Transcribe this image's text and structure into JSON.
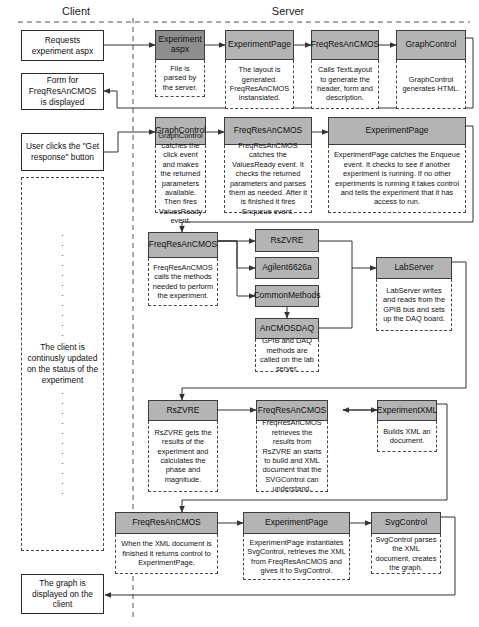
{
  "diagram": {
    "title_lanes": {
      "client": "Client",
      "server": "Server"
    },
    "client_boxes": [
      {
        "id": "requests",
        "text": "Requests experiment aspx"
      },
      {
        "id": "form-displayed",
        "text": "Form for FreqResAnCMOS is displayed"
      },
      {
        "id": "user-clicks",
        "text": "User clicks the \"Get response\" button"
      },
      {
        "id": "graph-displayed",
        "text": "The graph is displayed on the client"
      }
    ],
    "client_status": {
      "text": "The client is continusly updated on the status of the experiment",
      "dots_above": 11,
      "dots_below": 11
    },
    "nodes": [
      {
        "id": "experiment-aspx",
        "title": "Experiment aspx",
        "note": "File is parsed by the server.",
        "shade": "dark"
      },
      {
        "id": "experimentpage-1",
        "title": "ExperimentPage",
        "note": "The layout is generated. FreqResAnCMOS instansiated.",
        "shade": "light"
      },
      {
        "id": "freqresancmos-1",
        "title": "FreqResAnCMOS",
        "note": "Calls TextLayout to generate the header, form and description.",
        "shade": "light"
      },
      {
        "id": "graphcontrol-1",
        "title": "GraphControl",
        "note": "GraphControl generates HTML.",
        "shade": "light"
      },
      {
        "id": "graphcontrol-2",
        "title": "GraphControl",
        "note": "GraphControl catches the click event and makes the returned parameters available. Then fires ValuesReady event.",
        "shade": "light"
      },
      {
        "id": "freqresancmos-2",
        "title": "FreqResAnCMOS",
        "note": "FreqResAnCMOS catches the ValuesReady event. It checks the returned parameters and parses them as needed. After it is finished it fires Enqueue event.",
        "shade": "light"
      },
      {
        "id": "experimentpage-2",
        "title": "ExperimentPage",
        "note": "ExperimentPage catches the Enqueue event. It checks to see if another experiment is running. If no other experiments is running it takes control and tells the experiment that it has access to run.",
        "shade": "light"
      },
      {
        "id": "freqresancmos-3",
        "title": "FreqResAnCMOS",
        "note": "FreqResAnCMOS calls the methods needed to perform the experiment.",
        "shade": "light"
      },
      {
        "id": "rszvre-1",
        "title": "RsZVRE",
        "note": "",
        "shade": "light"
      },
      {
        "id": "agilent",
        "title": "Agilent6626a",
        "note": "",
        "shade": "light"
      },
      {
        "id": "commonmethods",
        "title": "CommonMethods",
        "note": "",
        "shade": "light"
      },
      {
        "id": "ancmosdaq",
        "title": "AnCMOSDAQ",
        "note": "GPIB and DAQ methods are called on the lab server.",
        "shade": "light"
      },
      {
        "id": "labserver",
        "title": "LabServer",
        "note": "LabServer writes and reads from the GPIB bus and sets up the DAQ board.",
        "shade": "light"
      },
      {
        "id": "rszvre-2",
        "title": "RsZVRE",
        "note": "RsZVRE gets the results of the experiment and calculates the phase and magnitude.",
        "shade": "light"
      },
      {
        "id": "freqresancmos-4",
        "title": "FreqResAnCMOS",
        "note": "FreqResAnCMOS retrieves the results from RsZVRE an starts to build and XML document that the SVGControl can understand.",
        "shade": "light"
      },
      {
        "id": "experimentxml",
        "title": "ExperimentXML",
        "note": "Builds XML an document.",
        "shade": "light"
      },
      {
        "id": "freqresancmos-5",
        "title": "FreqResAnCMOS",
        "note": "When the XML document is finished it returns control to ExperimentPage.",
        "shade": "light"
      },
      {
        "id": "experimentpage-3",
        "title": "ExperimentPage",
        "note": "ExperimentPage instantiates SvgControl, retrieves the XML from FreqResAnCMOS and gives it to SvgControl.",
        "shade": "light"
      },
      {
        "id": "svgcontrol",
        "title": "SvgControl",
        "note": "SvgControl parses the XML document, creates the graph.",
        "shade": "light"
      }
    ],
    "colors": {
      "node_fill": "#b4b4b4",
      "node_fill_dark": "#8e8e8e",
      "node_stroke": "#3d3d3d",
      "line": "#333333",
      "lane_divider": "#555555",
      "background": "#ffffff"
    }
  }
}
